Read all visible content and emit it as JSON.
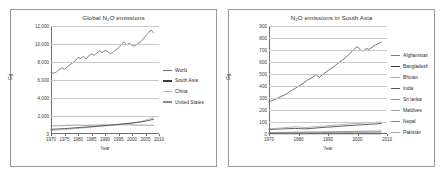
{
  "figure": {
    "background": "#ffffff",
    "panel_border_color": "#9a9a9a"
  },
  "charts": [
    {
      "id": "global",
      "title_main": "Global N",
      "title_sub": "2",
      "title_rest": "O emissions",
      "ylabel": "Gg",
      "xlabel": "Year",
      "yticks": [
        "0",
        "2,000",
        "4,000",
        "6,000",
        "8,000",
        "10,000",
        "12,000"
      ],
      "xticks": [
        "1970",
        "1975",
        "1980",
        "1985",
        "1990",
        "1995",
        "2000",
        "2005",
        "2010"
      ],
      "legend": [
        {
          "label": "World",
          "color": "#6f6f6f"
        },
        {
          "label": "South Asia",
          "color": "#3d3d3d"
        },
        {
          "label": "China",
          "color": "#b4b4b4"
        },
        {
          "label": "United States",
          "color": "#8a8a8a"
        }
      ]
    },
    {
      "id": "southasia",
      "title_main": "N",
      "title_sub": "2",
      "title_rest": "O emissions in South Asia",
      "ylabel": "Gg",
      "xlabel": "Year",
      "yticks": [
        "0",
        "100",
        "200",
        "300",
        "400",
        "500",
        "600",
        "700",
        "800",
        "900"
      ],
      "xticks": [
        "1970",
        "1980",
        "1990",
        "2000",
        "2010"
      ],
      "legend": [
        {
          "label": "Afghanistan",
          "color": "#7a7a7a"
        },
        {
          "label": "Bangladesh",
          "color": "#3d3d3d"
        },
        {
          "label": "Bhutan",
          "color": "#b0b0b0"
        },
        {
          "label": "India",
          "color": "#555555"
        },
        {
          "label": "Sri lanka",
          "color": "#8f8f8f"
        },
        {
          "label": "Maldives",
          "color": "#9c9c9c"
        },
        {
          "label": "Nepal",
          "color": "#858585"
        },
        {
          "label": "Pakistan",
          "color": "#a5a5a5"
        }
      ]
    }
  ],
  "chart_data": [
    {
      "type": "line",
      "title": "Global N2O emissions",
      "xlabel": "Year",
      "ylabel": "Gg",
      "xlim": [
        1970,
        2010
      ],
      "ylim": [
        0,
        12000
      ],
      "ytick_step": 2000,
      "xtick_step": 5,
      "grid": true,
      "legend_position": "right",
      "x": [
        1970,
        1971,
        1972,
        1973,
        1974,
        1975,
        1976,
        1977,
        1978,
        1979,
        1980,
        1981,
        1982,
        1983,
        1984,
        1985,
        1986,
        1987,
        1988,
        1989,
        1990,
        1991,
        1992,
        1993,
        1994,
        1995,
        1996,
        1997,
        1998,
        1999,
        2000,
        2001,
        2002,
        2003,
        2004,
        2005,
        2006,
        2007,
        2008
      ],
      "series": [
        {
          "name": "World",
          "color": "#6f6f6f",
          "values": [
            6850,
            6750,
            6900,
            7150,
            7350,
            7200,
            7450,
            7700,
            7900,
            8150,
            8500,
            8400,
            8600,
            8350,
            8700,
            8900,
            8750,
            9000,
            9250,
            9050,
            9300,
            9150,
            8900,
            9100,
            9350,
            9600,
            9900,
            10250,
            9900,
            10100,
            9850,
            9750,
            10000,
            10200,
            10500,
            10900,
            11200,
            11550,
            11250
          ]
        },
        {
          "name": "South Asia",
          "color": "#3d3d3d",
          "values": [
            520,
            540,
            555,
            575,
            590,
            600,
            620,
            640,
            665,
            690,
            700,
            730,
            750,
            770,
            790,
            810,
            840,
            865,
            890,
            910,
            940,
            965,
            990,
            1010,
            1040,
            1070,
            1100,
            1130,
            1160,
            1190,
            1220,
            1250,
            1290,
            1330,
            1380,
            1430,
            1500,
            1570,
            1650
          ]
        },
        {
          "name": "China",
          "color": "#b4b4b4",
          "values": [
            400,
            415,
            430,
            450,
            470,
            490,
            510,
            540,
            570,
            600,
            620,
            650,
            680,
            700,
            730,
            760,
            790,
            820,
            850,
            880,
            910,
            940,
            970,
            1000,
            1030,
            1060,
            1090,
            1120,
            1150,
            1180,
            1220,
            1260,
            1310,
            1370,
            1440,
            1530,
            1640,
            1760,
            1890
          ]
        },
        {
          "name": "United States",
          "color": "#8a8a8a",
          "values": [
            900,
            905,
            915,
            930,
            945,
            930,
            950,
            965,
            980,
            1000,
            985,
            975,
            960,
            950,
            965,
            980,
            975,
            985,
            1000,
            1010,
            1005,
            1000,
            1010,
            1020,
            1030,
            1020,
            1030,
            1040,
            1030,
            1020,
            1010,
            990,
            985,
            980,
            985,
            980,
            975,
            985,
            960
          ]
        }
      ]
    },
    {
      "type": "line",
      "title": "N2O emissions in South Asia",
      "xlabel": "Year",
      "ylabel": "Gg",
      "xlim": [
        1970,
        2010
      ],
      "ylim": [
        0,
        900
      ],
      "ytick_step": 100,
      "xtick_step": 10,
      "grid": true,
      "legend_position": "right",
      "x": [
        1970,
        1971,
        1972,
        1973,
        1974,
        1975,
        1976,
        1977,
        1978,
        1979,
        1980,
        1981,
        1982,
        1983,
        1984,
        1985,
        1986,
        1987,
        1988,
        1989,
        1990,
        1991,
        1992,
        1993,
        1994,
        1995,
        1996,
        1997,
        1998,
        1999,
        2000,
        2001,
        2002,
        2003,
        2004,
        2005,
        2006,
        2007,
        2008
      ],
      "series": [
        {
          "name": "India",
          "color": "#555555",
          "values": [
            268,
            278,
            288,
            300,
            312,
            322,
            335,
            352,
            368,
            382,
            398,
            412,
            430,
            448,
            462,
            478,
            495,
            470,
            492,
            510,
            528,
            545,
            562,
            580,
            600,
            618,
            638,
            660,
            685,
            710,
            728,
            700,
            690,
            712,
            705,
            725,
            740,
            752,
            765
          ]
        },
        {
          "name": "Pakistan",
          "color": "#a5a5a5",
          "values": [
            42,
            44,
            46,
            48,
            50,
            52,
            54,
            56,
            58,
            60,
            58,
            56,
            54,
            55,
            57,
            59,
            61,
            63,
            65,
            67,
            69,
            71,
            73,
            75,
            77,
            79,
            81,
            83,
            85,
            86,
            88,
            90,
            91,
            92,
            94,
            95,
            96,
            98,
            100
          ]
        },
        {
          "name": "Bangladesh",
          "color": "#3d3d3d",
          "values": [
            38,
            39,
            40,
            41,
            42,
            43,
            44,
            45,
            46,
            47,
            45,
            44,
            43,
            44,
            46,
            48,
            50,
            52,
            54,
            56,
            58,
            59,
            61,
            63,
            65,
            66,
            68,
            70,
            72,
            73,
            75,
            76,
            78,
            79,
            81,
            82,
            84,
            85,
            87
          ]
        },
        {
          "name": "Nepal",
          "color": "#858585",
          "values": [
            12,
            12,
            12,
            13,
            13,
            13,
            14,
            14,
            14,
            15,
            15,
            15,
            16,
            16,
            16,
            17,
            17,
            17,
            18,
            18,
            18,
            19,
            19,
            19,
            20,
            20,
            21,
            21,
            21,
            22,
            22,
            22,
            23,
            23,
            24,
            24,
            24,
            25,
            25
          ]
        },
        {
          "name": "Sri lanka",
          "color": "#8f8f8f",
          "values": [
            8,
            8,
            8,
            8,
            9,
            9,
            9,
            9,
            9,
            10,
            10,
            10,
            10,
            10,
            11,
            11,
            11,
            11,
            11,
            12,
            12,
            12,
            12,
            12,
            13,
            13,
            13,
            13,
            13,
            14,
            14,
            14,
            14,
            14,
            15,
            15,
            15,
            15,
            16
          ]
        },
        {
          "name": "Afghanistan",
          "color": "#7a7a7a",
          "values": [
            6,
            6,
            6,
            6,
            6,
            6,
            6,
            6,
            6,
            6,
            6,
            5,
            5,
            5,
            5,
            5,
            5,
            5,
            5,
            5,
            5,
            5,
            5,
            5,
            5,
            5,
            5,
            6,
            6,
            6,
            6,
            6,
            6,
            6,
            7,
            7,
            7,
            7,
            7
          ]
        },
        {
          "name": "Bhutan",
          "color": "#b0b0b0",
          "values": [
            2,
            2,
            2,
            2,
            2,
            2,
            2,
            2,
            2,
            2,
            2,
            2,
            2,
            2,
            2,
            2,
            2,
            2,
            2,
            2,
            2,
            2,
            2,
            2,
            2,
            2,
            2,
            2,
            2,
            2,
            2,
            2,
            2,
            2,
            2,
            2,
            2,
            2,
            2
          ]
        },
        {
          "name": "Maldives",
          "color": "#9c9c9c",
          "values": [
            1,
            1,
            1,
            1,
            1,
            1,
            1,
            1,
            1,
            1,
            1,
            1,
            1,
            1,
            1,
            1,
            1,
            1,
            1,
            1,
            1,
            1,
            1,
            1,
            1,
            1,
            1,
            1,
            1,
            1,
            1,
            1,
            1,
            1,
            1,
            1,
            1,
            1,
            1
          ]
        }
      ]
    }
  ]
}
